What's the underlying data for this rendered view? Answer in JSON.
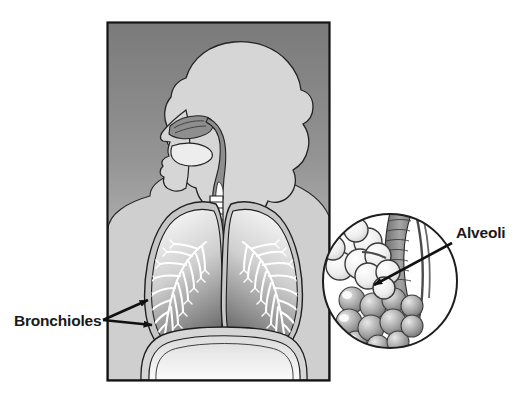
{
  "figure": {
    "background_color": "#ffffff"
  },
  "panel": {
    "name": "torso-panel",
    "x": 107,
    "y": 22,
    "width": 223,
    "height": 359,
    "border_color": "#141414",
    "gradient_top_color": "#7d7d7d",
    "gradient_bottom_color": "#d9d9d9"
  },
  "anatomy": {
    "head_silhouette": {
      "name": "head-and-hair-silhouette",
      "fill": "#d2d2d2",
      "stroke": "#1e1e1e"
    },
    "airway": {
      "name": "nasal-cavity-pharynx",
      "fill": "#8e8e8e",
      "stroke": "#1e1e1e"
    },
    "trachea": {
      "name": "trachea-and-bronchi",
      "fill": "#ffffff",
      "stroke": "#1e1e1e",
      "ring_count": 14
    },
    "lung_left": {
      "name": "left-lung",
      "fill_outer": "#c9c9c9",
      "fill_inner_top": "#f2f2f2",
      "fill_inner_bottom": "#6b6b6b",
      "stroke": "#1e1e1e"
    },
    "lung_right": {
      "name": "right-lung",
      "fill_outer": "#c9c9c9",
      "fill_inner_top": "#f2f2f2",
      "fill_inner_bottom": "#6b6b6b",
      "stroke": "#1e1e1e"
    },
    "bronchial_tree": {
      "name": "bronchial-tree-branches",
      "color": "#ffffff",
      "stroke": "#2a2a2a"
    },
    "diaphragm": {
      "name": "diaphragm-abdomen",
      "fill": "#ececec",
      "stroke": "#1e1e1e"
    }
  },
  "inset": {
    "name": "alveoli-magnification-circle",
    "cx": 390,
    "cy": 281,
    "r": 68,
    "fill": "#ffffff",
    "stroke": "#1e1e1e",
    "bronchiole_fill": "#8c8c8c",
    "alveoli_light_fill": "#f3f3f3",
    "alveoli_dark_fill": "#9a9a9a"
  },
  "labels": [
    {
      "id": "bronchioles",
      "text": "Bronchioles",
      "name": "label-bronchioles",
      "text_x": 14,
      "text_y": 326,
      "color": "#1a1a1a",
      "leader_origin": {
        "x": 103,
        "y": 320
      },
      "arrow_targets": [
        {
          "x": 150,
          "y": 299
        },
        {
          "x": 154,
          "y": 325
        }
      ]
    },
    {
      "id": "alveoli",
      "text": "Alveoli",
      "name": "label-alveoli",
      "text_x": 456,
      "text_y": 238,
      "color": "#1a1a1a",
      "leader_origin": {
        "x": 452,
        "y": 243
      },
      "arrow_targets": [
        {
          "x": 372,
          "y": 286
        }
      ]
    }
  ]
}
